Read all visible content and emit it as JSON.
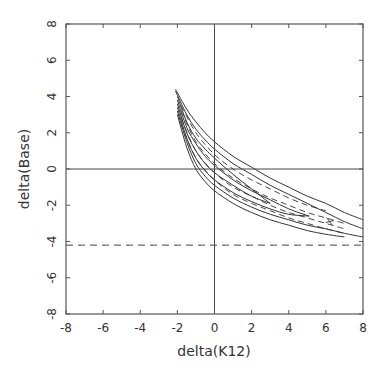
{
  "chart_data": {
    "type": "line",
    "title": "",
    "xlabel": "delta(K12)",
    "ylabel": "delta(Base)",
    "xlim": [
      -8,
      8
    ],
    "ylim": [
      -8,
      8
    ],
    "xticks": [
      -8,
      -6,
      -4,
      -2,
      0,
      2,
      4,
      6,
      8
    ],
    "yticks": [
      -8,
      -6,
      -4,
      -2,
      0,
      2,
      4,
      6,
      8
    ],
    "xtick_labels": [
      "-8",
      "-6",
      "-4",
      "-2",
      "0",
      "2",
      "4",
      "6",
      "8"
    ],
    "ytick_labels": [
      "-8",
      "-6",
      "-4",
      "-2",
      "0",
      "2",
      "4",
      "6",
      "8"
    ],
    "grid": false,
    "legend": null,
    "reference_lines": [
      {
        "orientation": "horizontal",
        "value": 0,
        "style": "solid"
      },
      {
        "orientation": "vertical",
        "value": 0,
        "style": "solid"
      },
      {
        "orientation": "horizontal",
        "value": -4.2,
        "style": "dashed"
      }
    ],
    "series": [
      {
        "name": "solid-upper-1",
        "style": "solid",
        "x": [
          -2.1,
          -1.5,
          -1.0,
          -0.5,
          0,
          1,
          2,
          3,
          4,
          5,
          6,
          7,
          8
        ],
        "y": [
          4.4,
          3.3,
          2.6,
          2.0,
          1.5,
          0.7,
          0.1,
          -0.5,
          -1.0,
          -1.5,
          -1.9,
          -2.4,
          -2.8
        ]
      },
      {
        "name": "solid-upper-2",
        "style": "solid",
        "x": [
          -2.1,
          -1.5,
          -1.0,
          -0.5,
          0,
          1,
          2,
          3,
          4,
          5,
          6,
          7,
          8
        ],
        "y": [
          4.3,
          3.0,
          2.2,
          1.6,
          1.1,
          0.3,
          -0.3,
          -0.9,
          -1.4,
          -1.9,
          -2.4,
          -2.9,
          -3.3
        ]
      },
      {
        "name": "solid-loop-a-upper",
        "style": "solid",
        "x": [
          -2.0,
          -1.5,
          -1.0,
          -0.5,
          0,
          1,
          2,
          3.0
        ],
        "y": [
          4.0,
          2.6,
          1.7,
          1.1,
          0.6,
          -0.3,
          -1.1,
          -1.9
        ]
      },
      {
        "name": "solid-loop-a-lower",
        "style": "solid",
        "x": [
          -2.0,
          -1.5,
          -1.0,
          -0.5,
          0,
          1,
          2,
          3.0
        ],
        "y": [
          3.6,
          2.0,
          1.0,
          0.3,
          -0.2,
          -0.9,
          -1.5,
          -1.9
        ]
      },
      {
        "name": "solid-loop-b-upper",
        "style": "solid",
        "x": [
          -2.0,
          -1.5,
          -1.0,
          -0.5,
          0,
          1,
          2,
          3,
          4,
          5.1
        ],
        "y": [
          3.8,
          2.3,
          1.4,
          0.7,
          0.2,
          -0.6,
          -1.2,
          -1.7,
          -2.2,
          -2.6
        ]
      },
      {
        "name": "solid-loop-b-lower",
        "style": "solid",
        "x": [
          -2.0,
          -1.5,
          -1.0,
          -0.5,
          0,
          1,
          2,
          3,
          4,
          5.1
        ],
        "y": [
          3.4,
          1.7,
          0.6,
          -0.1,
          -0.6,
          -1.3,
          -1.8,
          -2.2,
          -2.5,
          -2.6
        ]
      },
      {
        "name": "solid-lower-1",
        "style": "solid",
        "x": [
          -2.0,
          -1.5,
          -1.0,
          -0.5,
          0,
          1,
          2,
          3,
          4,
          5,
          6,
          7,
          8
        ],
        "y": [
          3.2,
          1.5,
          0.3,
          -0.4,
          -0.9,
          -1.6,
          -2.1,
          -2.5,
          -2.8,
          -3.1,
          -3.3,
          -3.55,
          -3.75
        ]
      },
      {
        "name": "solid-lower-2",
        "style": "solid",
        "x": [
          -2.0,
          -1.5,
          -1.0,
          -0.5,
          0,
          1,
          2,
          3,
          4,
          5,
          6,
          7
        ],
        "y": [
          3.0,
          1.2,
          0.0,
          -0.7,
          -1.2,
          -1.9,
          -2.4,
          -2.8,
          -3.1,
          -3.4,
          -3.6,
          -3.75
        ]
      },
      {
        "name": "dashed-1",
        "style": "dashed",
        "x": [
          -1.8,
          -1.0,
          0,
          1,
          2,
          3,
          4,
          5,
          6
        ],
        "y": [
          3.5,
          2.0,
          0.8,
          0.0,
          -0.6,
          -1.1,
          -1.6,
          -2.0,
          -2.3
        ]
      },
      {
        "name": "dashed-2",
        "style": "dashed",
        "x": [
          -1.8,
          -1.0,
          0,
          1,
          2,
          3,
          4,
          5,
          6,
          7
        ],
        "y": [
          3.2,
          1.5,
          0.3,
          -0.5,
          -1.1,
          -1.6,
          -2.0,
          -2.4,
          -2.7,
          -3.0
        ]
      },
      {
        "name": "dashed-3",
        "style": "dashed",
        "x": [
          -1.8,
          -1.0,
          0,
          1,
          2,
          3,
          4,
          5,
          6,
          7
        ],
        "y": [
          2.8,
          1.0,
          -0.2,
          -1.0,
          -1.5,
          -2.0,
          -2.4,
          -2.7,
          -3.0,
          -3.3
        ]
      },
      {
        "name": "dashed-4",
        "style": "dashed",
        "x": [
          -1.8,
          -1.0,
          0,
          1,
          2,
          3,
          4,
          5,
          6,
          7
        ],
        "y": [
          2.5,
          0.6,
          -0.6,
          -1.4,
          -1.9,
          -2.3,
          -2.7,
          -3.0,
          -3.3,
          -3.55
        ]
      }
    ],
    "annotations": [
      {
        "text": "small cross mark",
        "x": 6.2,
        "y": -2.9
      }
    ]
  },
  "axes": {
    "xlabel": "delta(K12)",
    "ylabel": "delta(Base)"
  },
  "colors": {
    "line": "#333333",
    "frame": "#555555",
    "background": "#ffffff"
  }
}
